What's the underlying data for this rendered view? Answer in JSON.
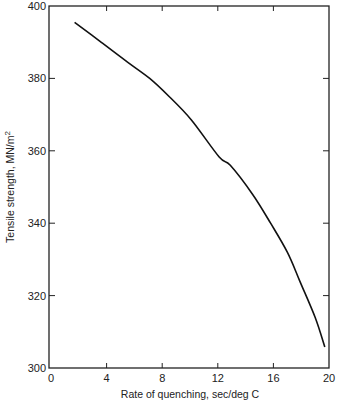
{
  "chart_data": {
    "type": "line",
    "title": "",
    "xlabel": "Rate of quenching, sec/deg C",
    "ylabel": "Tensile strength, MN/m²",
    "xlim": [
      0,
      20
    ],
    "ylim": [
      300,
      400
    ],
    "x_ticks": [
      0,
      4,
      8,
      12,
      16,
      20
    ],
    "y_ticks": [
      300,
      320,
      340,
      360,
      380,
      400
    ],
    "grid": false,
    "legend": null,
    "series": [
      {
        "name": "Tensile strength",
        "x": [
          1.7,
          3.5,
          5.5,
          7.1,
          8.5,
          10.1,
          12.1,
          12.9,
          14.5,
          15.8,
          17.0,
          17.9,
          19.0,
          19.7
        ],
        "y": [
          395.5,
          390.3,
          384.5,
          380.0,
          375.0,
          368.5,
          358.3,
          356.0,
          348.0,
          340.0,
          332.0,
          324.0,
          314.0,
          305.8
        ]
      }
    ]
  },
  "axes": {
    "x_label": "Rate of quenching, sec/deg C",
    "y_label_main": "Tensile strength, MN/m",
    "y_label_sup": "2"
  }
}
